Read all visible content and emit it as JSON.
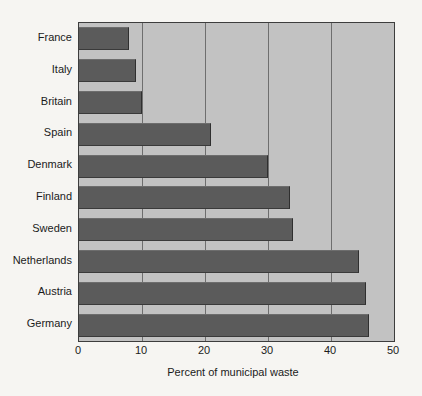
{
  "chart_data": {
    "type": "bar",
    "orientation": "horizontal",
    "title": "",
    "xlabel": "Percent of municipal waste",
    "ylabel": "",
    "categories": [
      "France",
      "Italy",
      "Britain",
      "Spain",
      "Denmark",
      "Finland",
      "Sweden",
      "Netherlands",
      "Austria",
      "Germany"
    ],
    "values": [
      8,
      9,
      10,
      21,
      30,
      33.5,
      34,
      44.5,
      45.5,
      46
    ],
    "xlim": [
      0,
      50
    ],
    "xticks": [
      0,
      10,
      20,
      30,
      40,
      50
    ],
    "xtick_labels": [
      "0",
      "10",
      "20",
      "30",
      "40",
      "50"
    ],
    "grid": "vertical",
    "legend": "none",
    "colors": {
      "bar": "#5b5b5b",
      "plot_background": "#c2c2c2",
      "page_background": "#f6f5f2",
      "axis": "#3d3d3d",
      "gridline": "#6e6e6e",
      "text": "#1b1b1b"
    }
  }
}
